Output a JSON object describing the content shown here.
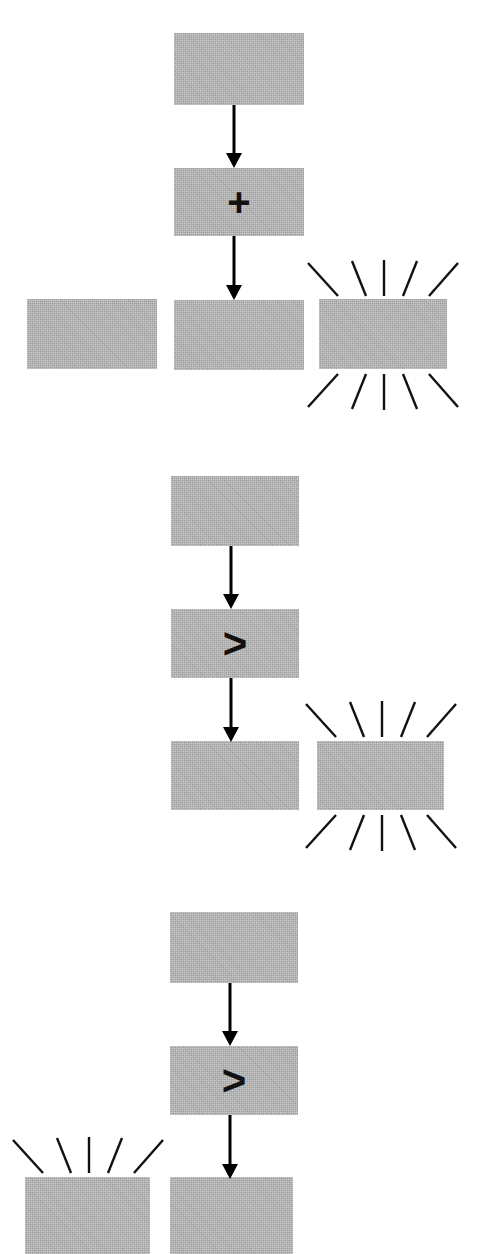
{
  "diagram": {
    "background_color": "#ffffff",
    "box_fill_color": "#b2b2b2",
    "stroke_color": "#111111",
    "box_label": "",
    "panel_count": 3
  },
  "panels": [
    {
      "id": "panel-1",
      "name": "addition-panel",
      "operator": "+",
      "operator_name": "plus-operator",
      "boxes": [
        {
          "name": "top-operand-box",
          "label": "",
          "highlighted": false
        },
        {
          "name": "operator-box",
          "label": "",
          "highlighted": false
        },
        {
          "name": "bottom-left-box",
          "label": "",
          "highlighted": false
        },
        {
          "name": "bottom-center-result-box",
          "label": "",
          "highlighted": false
        },
        {
          "name": "bottom-right-highlighted-box",
          "label": "",
          "highlighted": true
        }
      ],
      "arrows": [
        {
          "name": "arrow-top-to-operator",
          "direction": "down"
        },
        {
          "name": "arrow-operator-to-result",
          "direction": "down"
        }
      ],
      "sparkle": {
        "target": "bottom-right-highlighted-box",
        "above": true,
        "below": true,
        "ray_count": 5
      }
    },
    {
      "id": "panel-2",
      "name": "comparison-panel-right-highlight",
      "operator": ">",
      "operator_name": "greater-than-operator",
      "boxes": [
        {
          "name": "top-operand-box",
          "label": "",
          "highlighted": false
        },
        {
          "name": "operator-box",
          "label": "",
          "highlighted": false
        },
        {
          "name": "bottom-center-result-box",
          "label": "",
          "highlighted": false
        },
        {
          "name": "bottom-right-highlighted-box",
          "label": "",
          "highlighted": true
        }
      ],
      "arrows": [
        {
          "name": "arrow-top-to-operator",
          "direction": "down"
        },
        {
          "name": "arrow-operator-to-result",
          "direction": "down"
        }
      ],
      "sparkle": {
        "target": "bottom-right-highlighted-box",
        "above": true,
        "below": true,
        "ray_count": 5
      }
    },
    {
      "id": "panel-3",
      "name": "comparison-panel-left-highlight",
      "operator": ">",
      "operator_name": "greater-than-operator",
      "boxes": [
        {
          "name": "top-operand-box",
          "label": "",
          "highlighted": false
        },
        {
          "name": "operator-box",
          "label": "",
          "highlighted": false
        },
        {
          "name": "bottom-left-highlighted-box",
          "label": "",
          "highlighted": true
        },
        {
          "name": "bottom-center-result-box",
          "label": "",
          "highlighted": false
        }
      ],
      "arrows": [
        {
          "name": "arrow-top-to-operator",
          "direction": "down"
        },
        {
          "name": "arrow-operator-to-result",
          "direction": "down"
        }
      ],
      "sparkle": {
        "target": "bottom-left-highlighted-box",
        "above": true,
        "below": false,
        "ray_count": 5
      }
    }
  ]
}
